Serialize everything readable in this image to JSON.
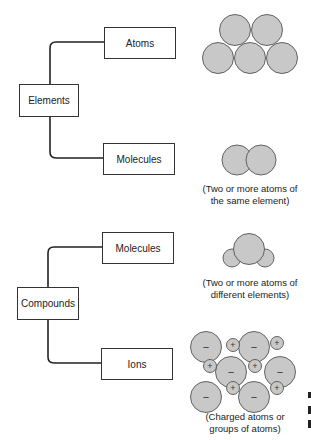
{
  "groups": [
    {
      "root": "Elements",
      "children": [
        {
          "label": "Atoms",
          "caption": ""
        },
        {
          "label": "Molecules",
          "caption_lines": [
            "(Two or more atoms of",
            "the same element)"
          ]
        }
      ]
    },
    {
      "root": "Compounds",
      "children": [
        {
          "label": "Molecules",
          "caption_lines": [
            "(Two or more atoms of",
            "different elements)"
          ]
        },
        {
          "label": "Ions",
          "caption_lines": [
            "(Charged atoms or",
            "groups of atoms)"
          ]
        }
      ]
    }
  ],
  "ion_signs": {
    "negative": "−",
    "positive": "+"
  },
  "colors": {
    "atom_fill": "#c8c8c8",
    "atom_stroke": "#555555",
    "line": "#222222"
  }
}
